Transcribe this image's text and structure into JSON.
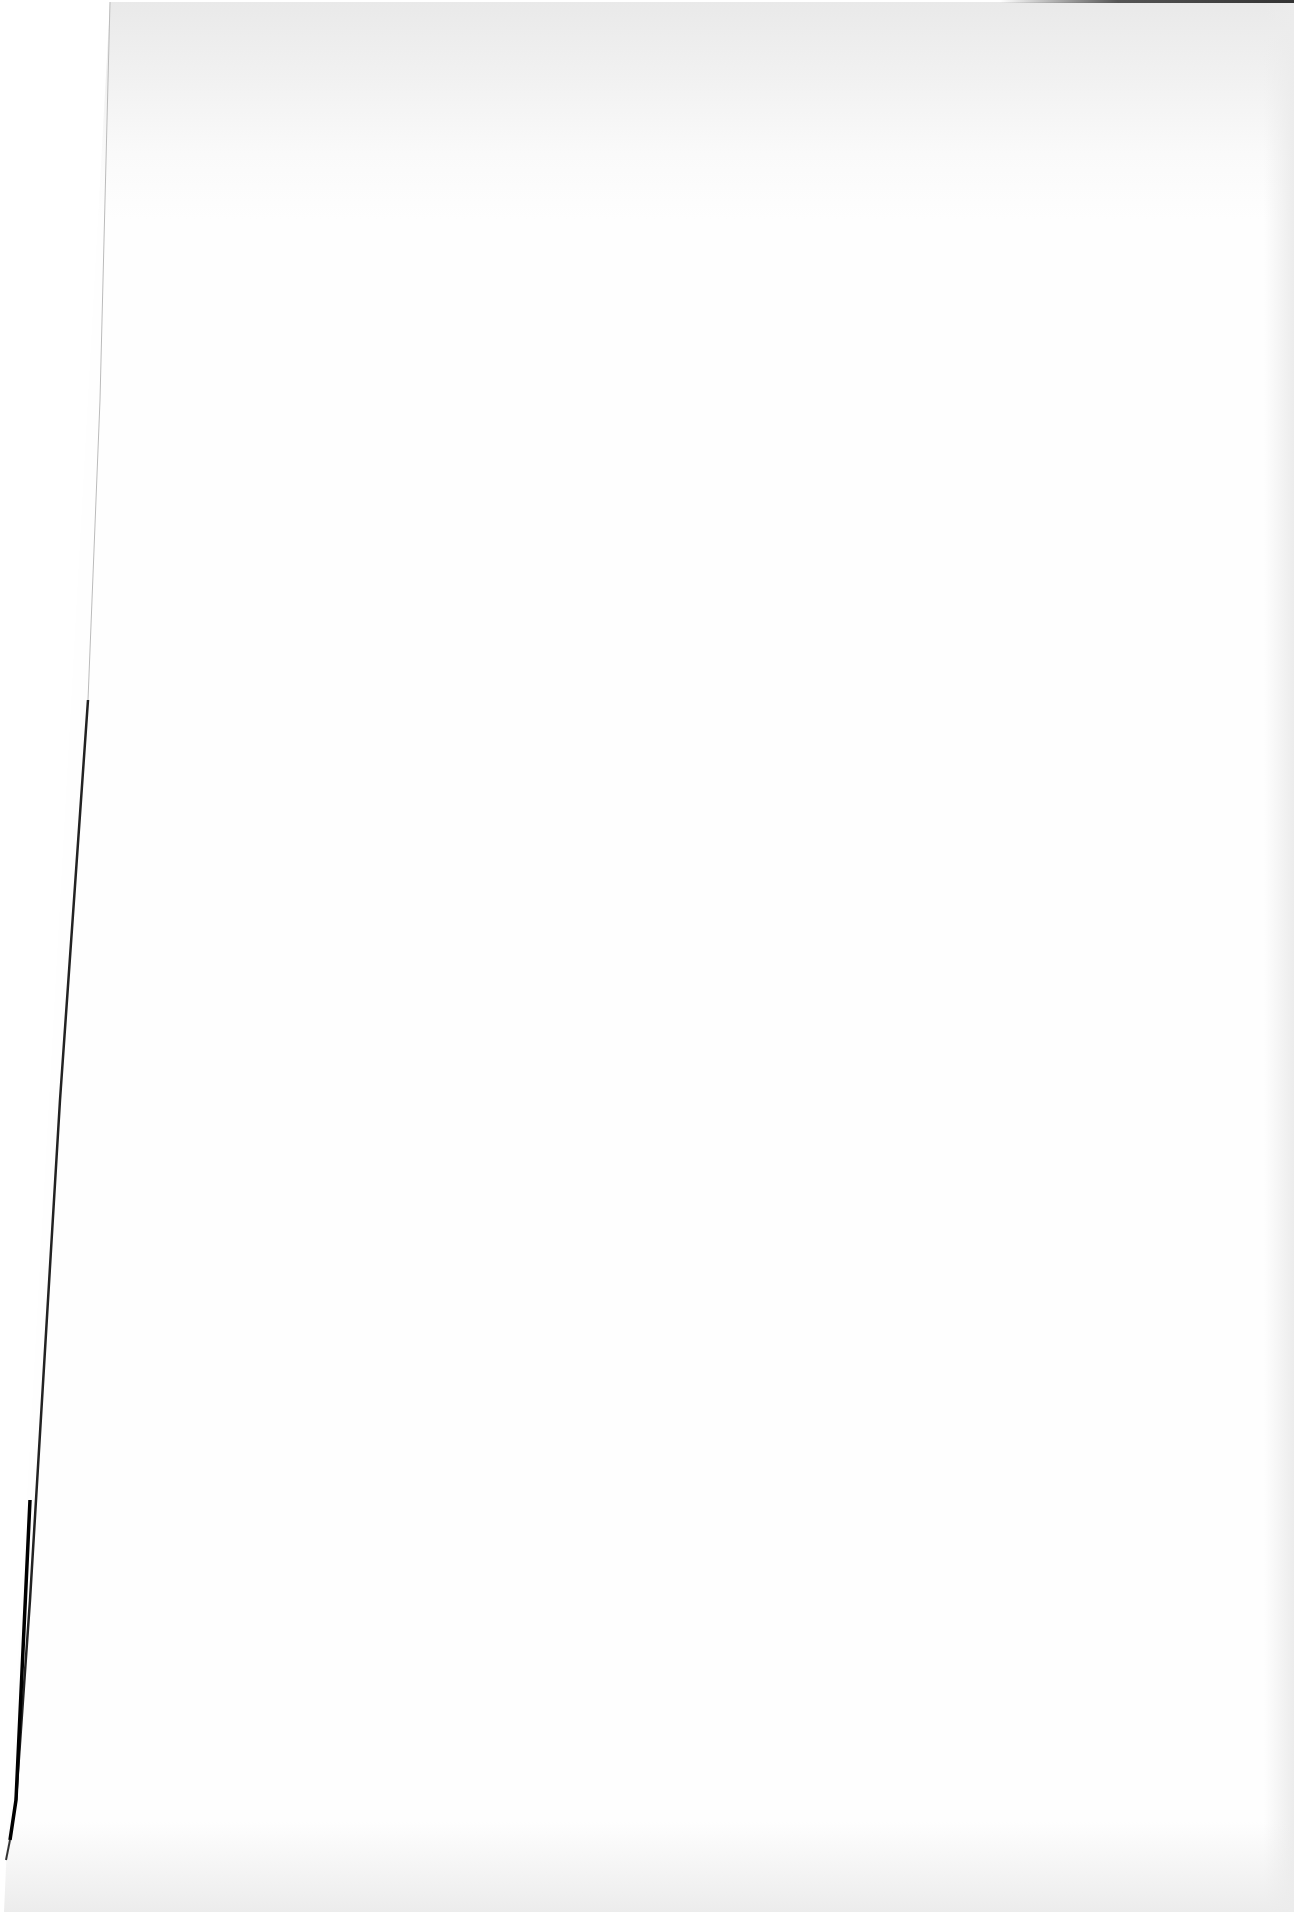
{
  "page": {
    "type": "blank-scanned-page",
    "text": ""
  },
  "colors": {
    "paper": "#fefefe",
    "edge": "#111111",
    "shade": "#e9e9e9"
  }
}
